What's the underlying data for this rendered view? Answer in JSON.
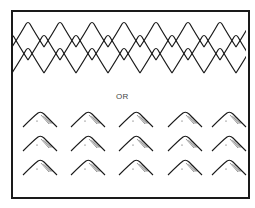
{
  "figure": {
    "divider_label": "OR",
    "stroke_color": "#1a1a1a",
    "background": "#ffffff",
    "frame": {
      "x": 11,
      "y": 10,
      "width": 237,
      "height": 187
    },
    "pattern": {
      "name": "overlapping-ridge-pattern",
      "rows": [
        {
          "baseline_y": 47,
          "peak_y": 22,
          "x_offset": 12
        },
        {
          "baseline_y": 60,
          "peak_y": 35,
          "x_offset": 28
        },
        {
          "baseline_y": 73,
          "peak_y": 48,
          "x_offset": 12
        }
      ],
      "period": 32,
      "x_start": 12,
      "x_end": 246
    },
    "mountain_grid": {
      "columns": [
        40,
        88,
        136,
        185,
        229
      ],
      "rows": [
        {
          "peak_y": 112,
          "base_y": 127
        },
        {
          "peak_y": 136,
          "base_y": 151
        },
        {
          "peak_y": 160,
          "base_y": 175
        }
      ],
      "half_width": 17
    }
  }
}
